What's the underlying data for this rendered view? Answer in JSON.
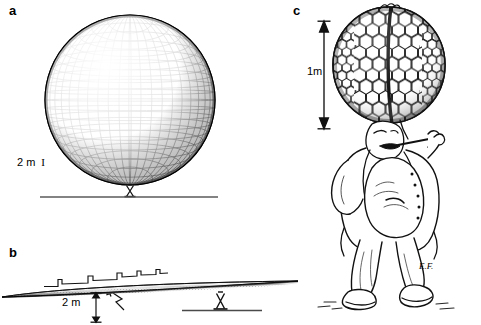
{
  "figure": {
    "background_color": "#ffffff",
    "ink_color": "#111111",
    "width": 481,
    "height": 325
  },
  "panels": [
    {
      "id": "a",
      "label": "a",
      "caption": "Wireframe sphere on a narrow pedestal support resting on a ground line",
      "subject": "gridded-sphere",
      "scale_label": "2 m",
      "scale_tick": "I"
    },
    {
      "id": "b",
      "label": "b",
      "caption": "Flattened lens-shaped disc seen edge-on, with stepped surface-profile detail and pedestal support",
      "subject": "flattened-disc",
      "scale_label": "2 m"
    },
    {
      "id": "c",
      "label": "c",
      "caption": "Cartoon figure with an enormous spherical head tiled with hexagonal cells, smoking a pipe",
      "subject": "hexagon-head-figure",
      "scale_label": "1m",
      "signature": "E.F."
    }
  ],
  "annotations": {
    "panel_a_scale": "2 m",
    "panel_a_scale_tick": "I",
    "panel_b_scale": "2 m",
    "panel_c_scale": "1m",
    "artist_signature": "E.F."
  },
  "icons": {
    "panel_b_pointer": "zigzag-arrow-icon",
    "panel_b_dimension": "double-headed-arrow-icon",
    "panel_c_dimension": "double-headed-arrow-icon"
  }
}
